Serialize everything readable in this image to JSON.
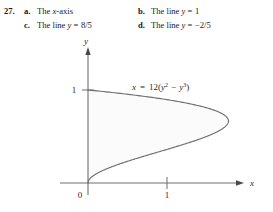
{
  "problem": {
    "number": "27.",
    "options": [
      {
        "label": "a.",
        "text": "The x-axis",
        "italic_var": "x"
      },
      {
        "label": "b.",
        "text": "The line y = 1",
        "italic_var": "y"
      },
      {
        "label": "c.",
        "text": "The line y = 8/5",
        "italic_var": "y"
      },
      {
        "label": "d.",
        "text": "The line y = −2/5",
        "italic_var": "y"
      }
    ]
  },
  "figure": {
    "equation_label": "x = 12(y² − y³)",
    "equation_parts": {
      "lhs": "x",
      "equals": "=",
      "coefficient": "12",
      "open": "(",
      "term1_base": "y",
      "term1_exp": "2",
      "minus": "−",
      "term2_base": "y",
      "term2_exp": "3",
      "close": ")"
    },
    "x_axis_label": "x",
    "y_axis_label": "y",
    "origin_label": "0",
    "x_tick_label": "1",
    "y_tick_label": "1",
    "colors": {
      "curve": "#6f6f6f",
      "axis": "#6f6f6f",
      "shade": "#fbfbfb",
      "text": "#2b2b2b"
    }
  },
  "chart_data": {
    "type": "line",
    "xlabel": "x",
    "ylabel": "y",
    "xlim": [
      -0.35,
      1.99
    ],
    "ylim": [
      -0.13,
      1.41
    ],
    "grid": false,
    "legend": false,
    "x_ticks": [
      0,
      1
    ],
    "x_tick_labels": [
      "0",
      "1"
    ],
    "y_ticks": [
      1
    ],
    "y_tick_labels": [
      "1"
    ],
    "origin_label": "0",
    "shaded_region": true,
    "shaded_region_bounds": "between curve x = 12(y^2 - y^3) and the y-axis (x = 0), for 0 <= y <= 1",
    "curve_equation": "x = 12*(y^2 - y^3)",
    "curve_max": {
      "y": 0.6667,
      "x": 1.7778
    },
    "curve_endpoints": [
      {
        "x": 0,
        "y": 0
      },
      {
        "x": 0,
        "y": 1
      }
    ],
    "series": [
      {
        "name": "x = 12(y^2 - y^3)",
        "points_y": [
          0.0,
          0.05,
          0.1,
          0.15,
          0.2,
          0.25,
          0.3,
          0.35,
          0.4,
          0.45,
          0.5,
          0.55,
          0.6,
          0.6667,
          0.7,
          0.75,
          0.8,
          0.85,
          0.9,
          0.95,
          1.0
        ],
        "points_x": [
          0.0,
          0.0285,
          0.108,
          0.2295,
          0.384,
          0.5625,
          0.756,
          0.9555,
          1.152,
          1.3365,
          1.5,
          1.6335,
          1.728,
          1.7778,
          1.764,
          1.6875,
          1.536,
          1.2997,
          0.972,
          0.5414,
          0.0
        ]
      }
    ]
  }
}
